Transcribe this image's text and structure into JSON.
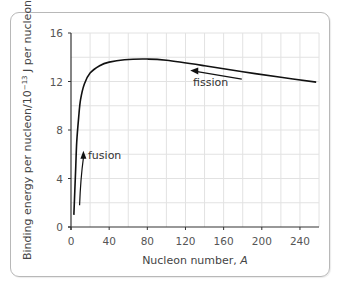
{
  "chart_data": {
    "type": "line",
    "title": "",
    "xlabel": "Nucleon number, A",
    "xlabel_text": "Nucleon number, ",
    "xlabel_var": "A",
    "ylabel": "Binding energy per nucleon/10⁻¹³ J per nucleon",
    "xlim": [
      0,
      260
    ],
    "ylim": [
      0,
      16
    ],
    "xticks": [
      0,
      40,
      80,
      120,
      160,
      200,
      240
    ],
    "yticks": [
      0,
      4,
      8,
      12,
      16
    ],
    "grid": true,
    "grid_minor_x_step": 20,
    "grid_minor_y_step": 2,
    "series": [
      {
        "name": "Binding energy per nucleon",
        "x": [
          3,
          4,
          5,
          6,
          8,
          10,
          14,
          20,
          30,
          40,
          56,
          80,
          100,
          140,
          180,
          220,
          257
        ],
        "y": [
          1.0,
          3.0,
          5.0,
          7.0,
          9.0,
          10.5,
          11.8,
          12.7,
          13.3,
          13.6,
          13.8,
          13.85,
          13.75,
          13.3,
          12.8,
          12.35,
          11.95
        ]
      }
    ],
    "annotations": [
      {
        "text": "fusion",
        "arrow_from": [
          9,
          1.8
        ],
        "arrow_to": [
          13,
          6.2
        ],
        "direction": "up"
      },
      {
        "text": "fission",
        "arrow_from": [
          179,
          12.2
        ],
        "arrow_to": [
          125,
          12.9
        ],
        "direction": "left"
      }
    ]
  },
  "labels": {
    "yaxis": "Binding energy per nucleon/10",
    "yaxis_exp": "−13",
    "yaxis_tail": " J per nucleon",
    "fusion": "fusion",
    "fission": "fission"
  },
  "colors": {
    "curve": "#111111",
    "grid": "#e2e2e2",
    "axis": "#333333",
    "frame": "#b8b8b8"
  }
}
